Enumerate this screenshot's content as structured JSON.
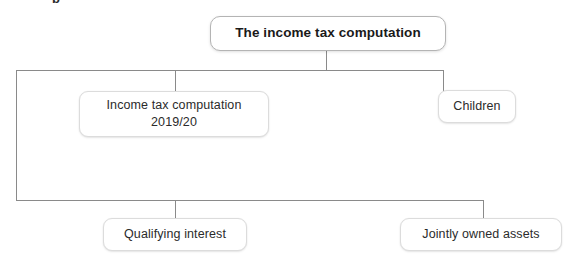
{
  "page": {
    "clipped_heading_fragment": "p",
    "background_color": "#ffffff",
    "line_color": "#8a8a8a",
    "box_border_color": "#dcdcdc",
    "root_border_color": "#b4b4b4",
    "text_color": "#2b2b2b"
  },
  "diagram": {
    "type": "hierarchy-tree",
    "root": {
      "label": "The income tax computation"
    },
    "nodes": [
      {
        "label": "Income tax computation\n2019/20"
      },
      {
        "label": "Children"
      },
      {
        "label": "Qualifying interest"
      },
      {
        "label": "Jointly owned assets"
      }
    ]
  }
}
